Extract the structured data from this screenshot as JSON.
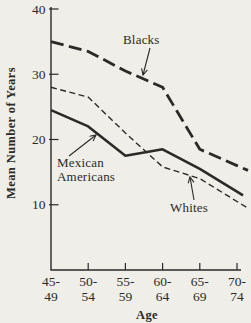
{
  "colors": {
    "background": "#efeee9",
    "ink": "#2b2a27"
  },
  "chart_data": {
    "type": "line",
    "title": "",
    "xlabel": "Age",
    "ylabel": "Mean Number of Years",
    "categories": [
      "45-49",
      "50-54",
      "55-59",
      "60-64",
      "65-69",
      "70-74"
    ],
    "yticks": [
      40,
      30,
      20,
      10
    ],
    "ylim": [
      0,
      41
    ],
    "grid": false,
    "legend_position": "inline-annotations",
    "series": [
      {
        "name": "Blacks",
        "style": "heavy-dashed",
        "values": [
          35,
          33.5,
          30.5,
          28,
          18.5,
          16
        ]
      },
      {
        "name": "Mexican Americans",
        "style": "solid",
        "values": [
          24.5,
          22,
          17.5,
          18.5,
          15.5,
          12
        ]
      },
      {
        "name": "Whites",
        "style": "light-dashed",
        "values": [
          28,
          26.5,
          21,
          15.8,
          14,
          10.5
        ]
      }
    ],
    "annotations": [
      {
        "label": "Blacks",
        "lines": [
          "Blacks"
        ],
        "text_x": 123,
        "text_y": 44,
        "arrow_from": [
          150,
          48
        ],
        "arrow_to": [
          143,
          75
        ]
      },
      {
        "label": "Mexican Americans",
        "lines": [
          "Mexican",
          "Americans"
        ],
        "text_x": 57,
        "text_y": 167,
        "arrow_from": [
          69,
          156
        ],
        "arrow_to": [
          96,
          135
        ]
      },
      {
        "label": "Whites",
        "lines": [
          "Whites"
        ],
        "text_x": 170,
        "text_y": 212,
        "arrow_from": [
          194,
          200
        ],
        "arrow_to": [
          190,
          177
        ]
      }
    ]
  }
}
